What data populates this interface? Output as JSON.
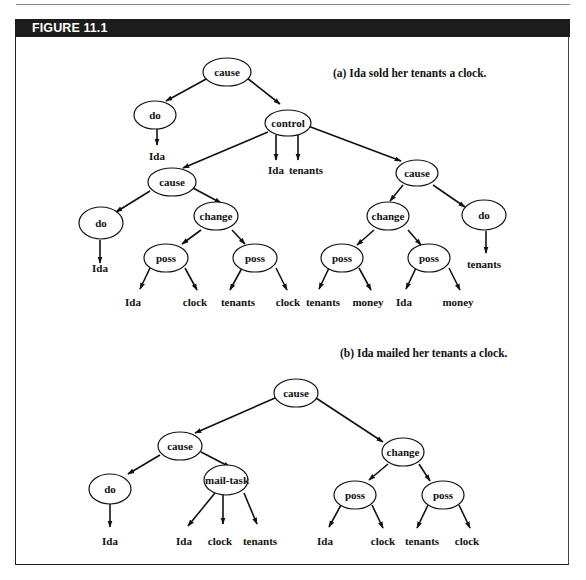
{
  "figure": {
    "label": "FIGURE 11.1",
    "colors": {
      "header_bg": "#1c1c1c",
      "header_text": "#ffffff",
      "ink": "#111111"
    }
  },
  "panel_a": {
    "caption": "(a) Ida sold her tenants a clock.",
    "nodes": {
      "root_cause": "cause",
      "do1": "do",
      "control": "control",
      "cause_left": "cause",
      "do_left": "do",
      "change_left": "change",
      "poss_ll": "poss",
      "poss_lr": "poss",
      "cause_right": "cause",
      "change_right": "change",
      "do_right": "do",
      "poss_rl": "poss",
      "poss_rr": "poss"
    },
    "leaves": {
      "do1_ida": "Ida",
      "control_ida": "Ida",
      "control_tenants": "tenants",
      "do_left_ida": "Ida",
      "poss_ll_ida": "Ida",
      "poss_ll_clock": "clock",
      "poss_lr_tenants": "tenants",
      "poss_lr_clock": "clock",
      "poss_rl_tenants": "tenants",
      "poss_rl_money": "money",
      "poss_rr_ida": "Ida",
      "poss_rr_money": "money",
      "do_right_tenants": "tenants"
    }
  },
  "panel_b": {
    "caption": "(b) Ida mailed her tenants a clock.",
    "nodes": {
      "root_cause": "cause",
      "cause": "cause",
      "do": "do",
      "mail_task": "mail-task",
      "change": "change",
      "poss_l": "poss",
      "poss_r": "poss"
    },
    "leaves": {
      "do_ida": "Ida",
      "mail_ida": "Ida",
      "mail_clock": "clock",
      "mail_tenants": "tenants",
      "poss_l_ida": "Ida",
      "poss_l_clock": "clock",
      "poss_r_tenants": "tenants",
      "poss_r_clock": "clock"
    }
  }
}
